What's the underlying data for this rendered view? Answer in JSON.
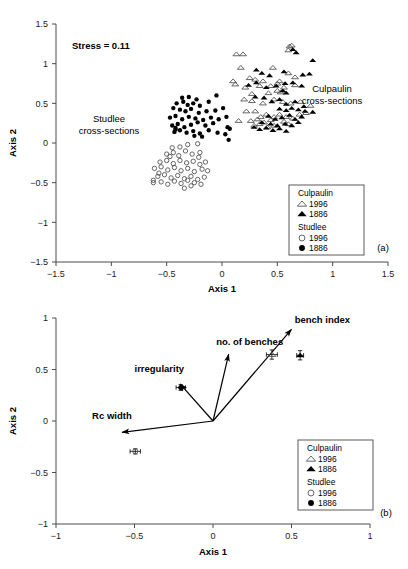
{
  "figure": {
    "panels": [
      {
        "id": "a",
        "label": "(a)",
        "annotation_stress": "Stress = 0.11",
        "group_labels": [
          {
            "name": "culpaulin-cross-sections",
            "line1": "Culpaulin",
            "line2": "cross-sections"
          },
          {
            "name": "studlee-cross-sections",
            "line1": "Studlee",
            "line2": "cross-sections"
          }
        ]
      },
      {
        "id": "b",
        "label": "(b)"
      }
    ],
    "legend": {
      "groups": [
        {
          "header": "Culpaulin",
          "items": [
            {
              "marker": "open-triangle-icon",
              "label": "1996"
            },
            {
              "marker": "filled-triangle-icon",
              "label": "1886"
            }
          ]
        },
        {
          "header": "Studlee",
          "items": [
            {
              "marker": "open-circle-icon",
              "label": "1996"
            },
            {
              "marker": "filled-circle-icon",
              "label": "1886"
            }
          ]
        }
      ]
    }
  },
  "chart_data": [
    {
      "type": "scatter",
      "panel": "a",
      "title": "",
      "annotation": "Stress = 0.11",
      "xlabel": "Axis 1",
      "ylabel": "Axis 2",
      "xlim": [
        -1.5,
        1.5
      ],
      "ylim": [
        -1.5,
        1.5
      ],
      "xticks": [
        "-1.5",
        "-1",
        "-0.5",
        "0",
        "0.5",
        "1",
        "1.5"
      ],
      "yticks": [
        "1.5",
        "1",
        "0.5",
        "0",
        "-0.5",
        "-1",
        "-1.5"
      ],
      "xtickvals": [
        -1.5,
        -1,
        -0.5,
        0,
        0.5,
        1,
        1.5
      ],
      "ytickvals": [
        1.5,
        1,
        0.5,
        0,
        -0.5,
        -1,
        -1.5
      ],
      "grid": false,
      "legend_position": "bottom-right",
      "series": [
        {
          "name": "Culpaulin 1996",
          "marker": "open-triangle",
          "points": [
            [
              0.13,
              1.12
            ],
            [
              0.19,
              1.12
            ],
            [
              0.61,
              1.22
            ],
            [
              0.63,
              1.23
            ],
            [
              0.6,
              1.17
            ],
            [
              0.17,
              0.95
            ],
            [
              0.25,
              0.82
            ],
            [
              0.1,
              0.78
            ],
            [
              0.12,
              0.74
            ],
            [
              0.3,
              0.8
            ],
            [
              0.37,
              0.78
            ],
            [
              0.46,
              0.95
            ],
            [
              0.52,
              0.78
            ],
            [
              0.6,
              0.88
            ],
            [
              0.66,
              0.83
            ],
            [
              0.21,
              0.7
            ],
            [
              0.34,
              0.72
            ],
            [
              0.27,
              0.62
            ],
            [
              0.44,
              0.72
            ],
            [
              0.5,
              0.75
            ],
            [
              0.42,
              0.63
            ],
            [
              0.5,
              0.66
            ],
            [
              0.53,
              0.64
            ],
            [
              0.56,
              0.7
            ],
            [
              0.66,
              0.73
            ],
            [
              0.2,
              0.55
            ],
            [
              0.27,
              0.53
            ],
            [
              0.37,
              0.5
            ],
            [
              0.47,
              0.55
            ],
            [
              0.55,
              0.52
            ],
            [
              0.62,
              0.5
            ],
            [
              0.71,
              0.52
            ],
            [
              0.8,
              0.47
            ],
            [
              0.22,
              0.4
            ],
            [
              0.3,
              0.4
            ],
            [
              0.35,
              0.33
            ],
            [
              0.4,
              0.36
            ],
            [
              0.47,
              0.33
            ],
            [
              0.52,
              0.36
            ],
            [
              0.58,
              0.33
            ],
            [
              0.64,
              0.31
            ],
            [
              0.7,
              0.36
            ],
            [
              0.76,
              0.38
            ],
            [
              0.26,
              0.28
            ],
            [
              0.32,
              0.3
            ],
            [
              0.38,
              0.26
            ],
            [
              0.44,
              0.29
            ],
            [
              0.15,
              0.28
            ],
            [
              0.56,
              0.27
            ],
            [
              0.6,
              0.24
            ],
            [
              0.47,
              0.22
            ],
            [
              0.41,
              0.2
            ],
            [
              0.34,
              0.24
            ],
            [
              0.29,
              0.22
            ]
          ]
        },
        {
          "name": "Culpaulin 1886",
          "marker": "filled-triangle",
          "points": [
            [
              0.64,
              1.18
            ],
            [
              0.67,
              1.14
            ],
            [
              0.82,
              1.04
            ],
            [
              0.31,
              0.92
            ],
            [
              0.36,
              0.88
            ],
            [
              0.43,
              0.85
            ],
            [
              0.56,
              0.9
            ],
            [
              0.73,
              0.86
            ],
            [
              0.79,
              0.87
            ],
            [
              0.24,
              0.73
            ],
            [
              0.31,
              0.76
            ],
            [
              0.4,
              0.7
            ],
            [
              0.49,
              0.72
            ],
            [
              0.57,
              0.75
            ],
            [
              0.55,
              0.66
            ],
            [
              0.58,
              0.63
            ],
            [
              0.64,
              0.76
            ],
            [
              0.72,
              0.72
            ],
            [
              0.3,
              0.58
            ],
            [
              0.38,
              0.57
            ],
            [
              0.45,
              0.52
            ],
            [
              0.52,
              0.55
            ],
            [
              0.58,
              0.49
            ],
            [
              0.66,
              0.52
            ],
            [
              0.74,
              0.46
            ],
            [
              0.82,
              0.39
            ],
            [
              0.52,
              0.43
            ],
            [
              0.58,
              0.41
            ],
            [
              0.63,
              0.44
            ],
            [
              0.69,
              0.42
            ],
            [
              0.75,
              0.4
            ],
            [
              0.42,
              0.34
            ],
            [
              0.48,
              0.3
            ],
            [
              0.54,
              0.32
            ],
            [
              0.61,
              0.35
            ],
            [
              0.66,
              0.3
            ],
            [
              0.72,
              0.33
            ],
            [
              0.36,
              0.26
            ],
            [
              0.44,
              0.24
            ],
            [
              0.5,
              0.22
            ],
            [
              0.57,
              0.24
            ],
            [
              0.63,
              0.22
            ],
            [
              0.69,
              0.26
            ],
            [
              0.29,
              0.2
            ],
            [
              0.34,
              0.17
            ],
            [
              0.4,
              0.19
            ],
            [
              0.46,
              0.16
            ],
            [
              0.52,
              0.18
            ],
            [
              0.58,
              0.15
            ]
          ]
        },
        {
          "name": "Studlee 1886",
          "marker": "filled-circle",
          "points": [
            [
              -0.36,
              0.57
            ],
            [
              -0.3,
              0.58
            ],
            [
              -0.23,
              0.55
            ],
            [
              -0.05,
              0.6
            ],
            [
              -0.41,
              0.5
            ],
            [
              -0.35,
              0.52
            ],
            [
              -0.31,
              0.48
            ],
            [
              -0.26,
              0.5
            ],
            [
              -0.2,
              0.47
            ],
            [
              -0.12,
              0.52
            ],
            [
              -0.44,
              0.44
            ],
            [
              -0.38,
              0.42
            ],
            [
              -0.33,
              0.4
            ],
            [
              -0.28,
              0.43
            ],
            [
              -0.21,
              0.38
            ],
            [
              -0.14,
              0.4
            ],
            [
              -0.06,
              0.41
            ],
            [
              0.01,
              0.44
            ],
            [
              -0.47,
              0.32
            ],
            [
              -0.42,
              0.34
            ],
            [
              -0.36,
              0.3
            ],
            [
              -0.3,
              0.33
            ],
            [
              -0.24,
              0.31
            ],
            [
              -0.17,
              0.29
            ],
            [
              -0.1,
              0.32
            ],
            [
              -0.03,
              0.3
            ],
            [
              0.04,
              0.33
            ],
            [
              -0.45,
              0.22
            ],
            [
              -0.4,
              0.24
            ],
            [
              -0.34,
              0.2
            ],
            [
              -0.28,
              0.23
            ],
            [
              -0.22,
              0.26
            ],
            [
              -0.15,
              0.22
            ],
            [
              -0.08,
              0.25
            ],
            [
              0.05,
              0.2
            ],
            [
              -0.43,
              0.14
            ],
            [
              -0.38,
              0.16
            ],
            [
              -0.32,
              0.13
            ],
            [
              -0.26,
              0.15
            ],
            [
              -0.2,
              0.12
            ],
            [
              -0.12,
              0.16
            ],
            [
              -0.04,
              0.13
            ],
            [
              0.03,
              0.11
            ],
            [
              0.07,
              0.18
            ],
            [
              0.06,
              0.04
            ],
            [
              -0.42,
              0.17
            ],
            [
              -0.42,
              0.19
            ],
            [
              -0.25,
              0.09
            ],
            [
              -0.18,
              0.08
            ]
          ]
        },
        {
          "name": "Studlee 1996",
          "marker": "open-circle",
          "points": [
            [
              -0.31,
              -0.02
            ],
            [
              -0.22,
              -0.01
            ],
            [
              -0.45,
              -0.06
            ],
            [
              -0.38,
              -0.05
            ],
            [
              -0.5,
              -0.14
            ],
            [
              -0.44,
              -0.12
            ],
            [
              -0.39,
              -0.16
            ],
            [
              -0.33,
              -0.1
            ],
            [
              -0.27,
              -0.14
            ],
            [
              -0.2,
              -0.12
            ],
            [
              -0.56,
              -0.24
            ],
            [
              -0.5,
              -0.22
            ],
            [
              -0.44,
              -0.26
            ],
            [
              -0.38,
              -0.22
            ],
            [
              -0.32,
              -0.25
            ],
            [
              -0.26,
              -0.23
            ],
            [
              -0.2,
              -0.27
            ],
            [
              -0.15,
              -0.24
            ],
            [
              -0.61,
              -0.32
            ],
            [
              -0.55,
              -0.3
            ],
            [
              -0.49,
              -0.34
            ],
            [
              -0.43,
              -0.31
            ],
            [
              -0.37,
              -0.35
            ],
            [
              -0.31,
              -0.32
            ],
            [
              -0.25,
              -0.36
            ],
            [
              -0.18,
              -0.33
            ],
            [
              -0.13,
              -0.35
            ],
            [
              -0.58,
              -0.42
            ],
            [
              -0.52,
              -0.4
            ],
            [
              -0.46,
              -0.44
            ],
            [
              -0.4,
              -0.41
            ],
            [
              -0.34,
              -0.45
            ],
            [
              -0.28,
              -0.42
            ],
            [
              -0.22,
              -0.46
            ],
            [
              -0.16,
              -0.43
            ],
            [
              -0.62,
              -0.47
            ],
            [
              -0.62,
              -0.5
            ],
            [
              -0.55,
              -0.49
            ],
            [
              -0.49,
              -0.52
            ],
            [
              -0.43,
              -0.48
            ],
            [
              -0.37,
              -0.51
            ],
            [
              -0.31,
              -0.47
            ],
            [
              -0.25,
              -0.5
            ],
            [
              -0.19,
              -0.52
            ],
            [
              -0.34,
              -0.57
            ],
            [
              -0.28,
              -0.54
            ],
            [
              -0.57,
              -0.38
            ],
            [
              -0.21,
              -0.18
            ],
            [
              -0.47,
              -0.17
            ]
          ]
        }
      ]
    },
    {
      "type": "scatter",
      "panel": "b",
      "title": "",
      "xlabel": "Axis 1",
      "ylabel": "Axis 2",
      "xlim": [
        -1,
        1
      ],
      "ylim": [
        -1,
        1
      ],
      "xticks": [
        "-1",
        "-0.5",
        "0",
        "0.5",
        "1"
      ],
      "yticks": [
        "1",
        "0.5",
        "0",
        "-0.5",
        "-1"
      ],
      "xtickvals": [
        -1,
        -0.5,
        0,
        0.5,
        1
      ],
      "ytickvals": [
        1,
        0.5,
        0,
        -0.5,
        -1
      ],
      "grid": false,
      "legend_position": "bottom-right",
      "vectors": [
        {
          "label": "bench index",
          "from": [
            0,
            0
          ],
          "to": [
            0.5,
            0.89
          ],
          "label_pos": [
            0.52,
            0.95
          ]
        },
        {
          "label": "no. of benches",
          "from": [
            0,
            0
          ],
          "to": [
            0.1,
            0.65
          ],
          "label_pos": [
            0.02,
            0.74
          ]
        },
        {
          "label": "irregularity",
          "from": [
            0,
            0
          ],
          "to": [
            -0.21,
            0.36
          ],
          "label_pos": [
            -0.5,
            0.48
          ]
        },
        {
          "label": "Rc width",
          "from": [
            0,
            0
          ],
          "to": [
            -0.58,
            -0.11
          ],
          "label_pos": [
            -0.77,
            0.02
          ]
        }
      ],
      "series": [
        {
          "name": "Culpaulin 1996",
          "marker": "open-triangle",
          "points": [
            [
              0.375,
              0.645
            ]
          ],
          "xerr": [
            0.035
          ],
          "yerr": [
            0.045
          ]
        },
        {
          "name": "Culpaulin 1886",
          "marker": "filled-triangle",
          "points": [
            [
              0.555,
              0.638
            ]
          ],
          "xerr": [
            0.022
          ],
          "yerr": [
            0.045
          ]
        },
        {
          "name": "Studlee 1886",
          "marker": "filled-circle",
          "points": [
            [
              -0.205,
              0.325
            ]
          ],
          "xerr": [
            0.03
          ],
          "yerr": [
            0.028
          ]
        },
        {
          "name": "Studlee 1996",
          "marker": "open-circle",
          "points": [
            [
              -0.495,
              -0.295
            ]
          ],
          "xerr": [
            0.033
          ],
          "yerr": [
            0.025
          ]
        }
      ]
    }
  ]
}
